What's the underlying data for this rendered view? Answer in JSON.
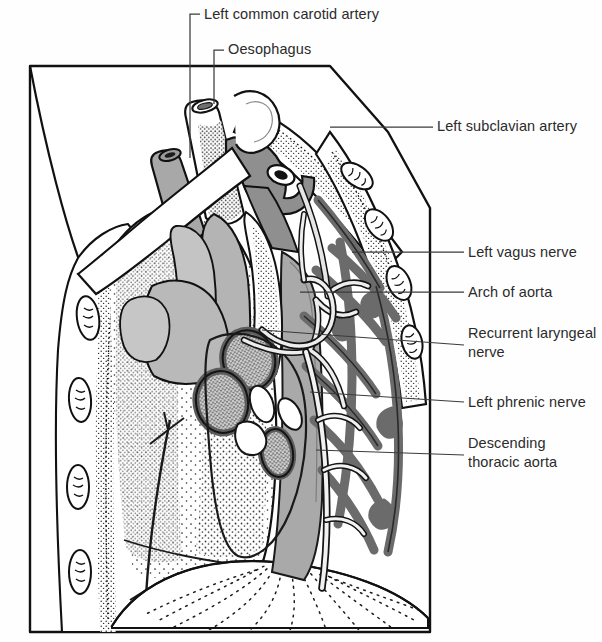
{
  "figure": {
    "type": "anatomical-line-diagram",
    "canvas": {
      "width": 602,
      "height": 642
    },
    "colors": {
      "ink": "#1a1a1a",
      "text": "#2b2b2b",
      "leader": "#3a3a3a",
      "paper": "#ffffff",
      "aorta_gray": "#a9a9a9",
      "vessel_mid_gray": "#9a9a9a",
      "nerve_dark_gray": "#6e6e6e",
      "stipple": "#262626",
      "node_fill": "#c9c9c9"
    }
  },
  "labels": [
    {
      "id": "carotid",
      "text": "Left common carotid artery",
      "leader": "elbow-down-left"
    },
    {
      "id": "oesophagus",
      "text": "Oesophagus",
      "leader": "elbow-down-left"
    },
    {
      "id": "subclavian",
      "text": "Left subclavian artery",
      "leader": "straight-left"
    },
    {
      "id": "vagus",
      "text": "Left vagus nerve",
      "leader": "straight-left"
    },
    {
      "id": "arch",
      "text": "Arch of aorta",
      "leader": "straight-left"
    },
    {
      "id": "recurrent_line1",
      "text": "Recurrent laryngeal",
      "leader": "straight-left"
    },
    {
      "id": "recurrent_line2",
      "text": "nerve",
      "leader": "none"
    },
    {
      "id": "phrenic",
      "text": "Left phrenic nerve",
      "leader": "straight-left"
    },
    {
      "id": "descending_line1",
      "text": "Descending",
      "leader": "none"
    },
    {
      "id": "descending_line2",
      "text": "thoracic aorta",
      "leader": "straight-left"
    }
  ],
  "label_text": {
    "carotid": "Left common carotid artery",
    "oesophagus": "Oesophagus",
    "subclavian": "Left subclavian artery",
    "vagus": "Left vagus nerve",
    "arch": "Arch of aorta",
    "recurrent": "Recurrent laryngeal\nnerve",
    "phrenic": "Left phrenic nerve",
    "descending": "Descending\nthoracic aorta"
  },
  "structures": [
    {
      "name": "thoracic-wall-outline",
      "note": "hexagonal cut edge of chest wall"
    },
    {
      "name": "ribs-left-posterior",
      "note": "stippled ribs with intercostal vessel ovals"
    },
    {
      "name": "ribs-right-anterior",
      "note": "stippled ribs with intercostal vessel ovals"
    },
    {
      "name": "lung-mediastinal-surface",
      "note": "stippled pleural surface"
    },
    {
      "name": "diaphragm",
      "note": "radiating dotted fan at base"
    },
    {
      "name": "oesophagus-stump",
      "note": "cut tube, upper left of hilum"
    },
    {
      "name": "left-common-carotid-stump",
      "note": "small cut artery, dark lumen"
    },
    {
      "name": "left-subclavian-artery",
      "note": "passes posterolaterally"
    },
    {
      "name": "aortic-arch",
      "note": "mid-gray curved arch"
    },
    {
      "name": "descending-thoracic-aorta",
      "note": "broad vertical gray band"
    },
    {
      "name": "left-vagus-nerve",
      "note": "pale nerve crossing arch, gives branches"
    },
    {
      "name": "recurrent-laryngeal-nerve",
      "note": "hooks under arch of aorta"
    },
    {
      "name": "left-phrenic-nerve",
      "note": "descends anterior to hilum to diaphragm"
    },
    {
      "name": "hilar-lymph-nodes",
      "note": "three stippled oval nodes with dark rims"
    },
    {
      "name": "intercostal-nerve-network",
      "note": "dark branching posterior network"
    }
  ]
}
